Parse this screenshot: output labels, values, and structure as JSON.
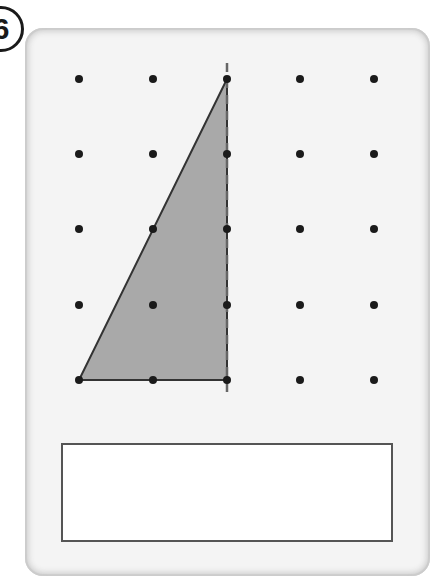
{
  "question": {
    "number": "6"
  },
  "dot_grid": {
    "columns": 5,
    "rows": 5,
    "x_positions": [
      79,
      153,
      227,
      300,
      374
    ],
    "y_positions": [
      79,
      154,
      229,
      305,
      380
    ],
    "dot_color": "#1a1a1a"
  },
  "shape": {
    "type": "right-triangle",
    "vertices_grid": [
      [
        0,
        4
      ],
      [
        2,
        4
      ],
      [
        2,
        0
      ]
    ],
    "fill": "#a9a9a9",
    "stroke": "#333333"
  },
  "mirror_line": {
    "style": "dashed",
    "column": 2,
    "color": "#666666"
  },
  "answer_box": {
    "value": ""
  }
}
